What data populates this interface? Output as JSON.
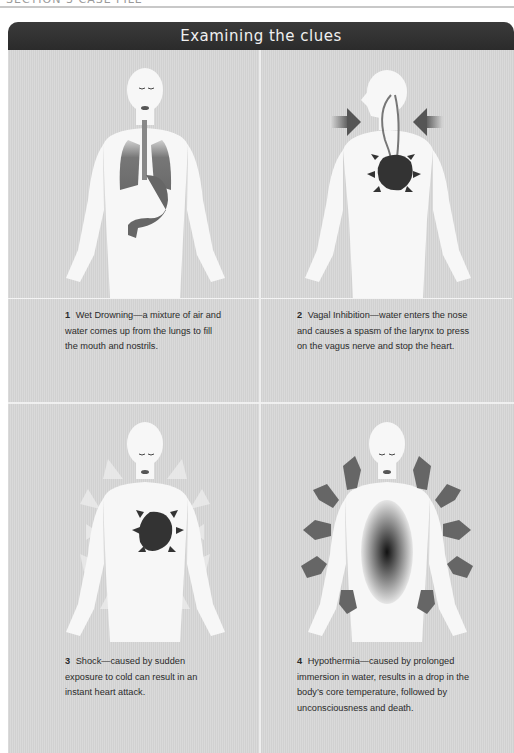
{
  "page": {
    "top_header_cut_text": "SECTION 3 CASE FILE",
    "title": "Examining the clues"
  },
  "panels": [
    {
      "number": "1",
      "text": "Wet Drowning—a mixture of air and water comes up from the lungs to fill the mouth and nostrils.",
      "illustration": "lungs-stomach-filled"
    },
    {
      "number": "2",
      "text": "Vagal Inhibition—water enters the nose and causes a spasm of the larynx to press on the vagus nerve and stop the heart.",
      "illustration": "vagus-nerve-heart"
    },
    {
      "number": "3",
      "text": "Shock—caused by sudden exposure to cold can result in an instant heart attack.",
      "illustration": "heart-cold-arrows"
    },
    {
      "number": "4",
      "text": "Hypothermia—caused by prolonged immersion in water, results in a drop in the body’s core temperature, followed by unconsciousness and death.",
      "illustration": "core-heat-loss-arrows"
    }
  ],
  "colors": {
    "header_bg": "#2e2e2e",
    "panel_bg": "#d6d6d6",
    "body_fill": "#f7f7f7",
    "organ_dark": "#3a3a3a"
  }
}
